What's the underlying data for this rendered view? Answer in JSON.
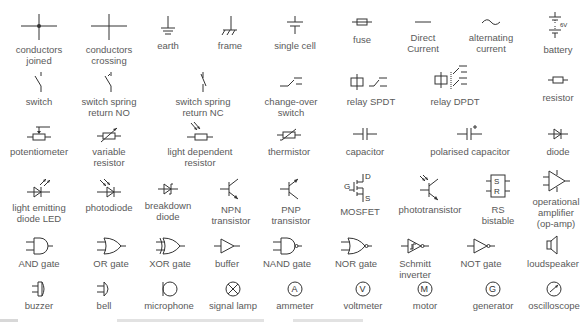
{
  "rows": [
    [
      {
        "name": "conductors-joined",
        "label": "conductors\njoined"
      },
      {
        "name": "conductors-crossing",
        "label": "conductors\ncrossing"
      },
      {
        "name": "earth",
        "label": "earth"
      },
      {
        "name": "frame",
        "label": "frame"
      },
      {
        "name": "single-cell",
        "label": "single cell"
      },
      {
        "name": "fuse",
        "label": "fuse"
      },
      {
        "name": "direct-current",
        "label": "Direct\nCurrent"
      },
      {
        "name": "alternating-current",
        "label": "alternating\ncurrent"
      },
      {
        "name": "battery",
        "label": "battery",
        "symbol_text": "6V"
      }
    ],
    [
      {
        "name": "switch",
        "label": "switch"
      },
      {
        "name": "switch-spring-return-no",
        "label": "switch spring\nreturn NO"
      },
      {
        "name": "switch-spring-return-nc",
        "label": "switch spring\nreturn NC"
      },
      {
        "name": "change-over-switch",
        "label": "change-over\nswitch"
      },
      {
        "name": "relay-spdt",
        "label": "relay SPDT"
      },
      {
        "name": "relay-dpdt",
        "label": "relay DPDT"
      },
      {
        "name": "resistor",
        "label": "resistor"
      }
    ],
    [
      {
        "name": "potentiometer",
        "label": "potentiometer"
      },
      {
        "name": "variable-resistor",
        "label": "variable\nresistor"
      },
      {
        "name": "light-dependent-resistor",
        "label": "light dependent\nresistor"
      },
      {
        "name": "thermistor",
        "label": "thermistor"
      },
      {
        "name": "capacitor",
        "label": "capacitor"
      },
      {
        "name": "polarised-capacitor",
        "label": "polarised capacitor"
      },
      {
        "name": "diode",
        "label": "diode"
      }
    ],
    [
      {
        "name": "led",
        "label": "light emitting\ndiode LED"
      },
      {
        "name": "photodiode",
        "label": "photodiode"
      },
      {
        "name": "breakdown-diode",
        "label": "breakdown\ndiode"
      },
      {
        "name": "npn-transistor",
        "label": "NPN\ntransistor"
      },
      {
        "name": "pnp-transistor",
        "label": "PNP\ntransistor"
      },
      {
        "name": "mosfet",
        "label": "MOSFET",
        "symbol_text": {
          "g": "G",
          "d": "D",
          "s": "S"
        }
      },
      {
        "name": "phototransistor",
        "label": "phototransistor"
      },
      {
        "name": "rs-bistable",
        "label": "RS\nbistable",
        "symbol_text": {
          "s": "S",
          "r": "R"
        }
      },
      {
        "name": "op-amp",
        "label": "operational\namplifier\n(op-amp)"
      }
    ],
    [
      {
        "name": "and-gate",
        "label": "AND gate"
      },
      {
        "name": "or-gate",
        "label": "OR gate"
      },
      {
        "name": "xor-gate",
        "label": "XOR gate"
      },
      {
        "name": "buffer",
        "label": "buffer"
      },
      {
        "name": "nand-gate",
        "label": "NAND gate"
      },
      {
        "name": "nor-gate",
        "label": "NOR gate"
      },
      {
        "name": "schmitt-inverter",
        "label": "Schmitt\ninverter"
      },
      {
        "name": "not-gate",
        "label": "NOT gate"
      },
      {
        "name": "loudspeaker",
        "label": "loudspeaker"
      }
    ],
    [
      {
        "name": "buzzer",
        "label": "buzzer"
      },
      {
        "name": "bell",
        "label": "bell"
      },
      {
        "name": "microphone",
        "label": "microphone"
      },
      {
        "name": "signal-lamp",
        "label": "signal lamp"
      },
      {
        "name": "ammeter",
        "label": "ammeter",
        "symbol_text": "A"
      },
      {
        "name": "voltmeter",
        "label": "voltmeter",
        "symbol_text": "V"
      },
      {
        "name": "motor",
        "label": "motor",
        "symbol_text": "M"
      },
      {
        "name": "generator",
        "label": "generator",
        "symbol_text": "G"
      },
      {
        "name": "oscilloscope",
        "label": "oscilloscope"
      }
    ]
  ]
}
